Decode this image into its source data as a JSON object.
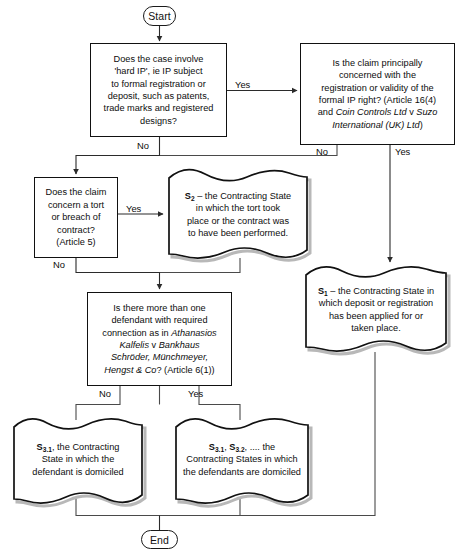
{
  "diagram": {
    "start_label": "Start",
    "end_label": "End",
    "colors": {
      "stroke": "#111111",
      "background": "#ffffff",
      "shadow": "#b8b8b8",
      "connector": "#4a4a4a"
    },
    "nodes": {
      "hard_ip": {
        "text": "Does the case involve 'hard IP', ie IP subject to formal registration or deposit, such as patents, trade marks and registered designs?",
        "shape": "process"
      },
      "registration_validity": {
        "text": "Is the claim principally concerned with the registration or validity of the formal IP right? (Article 16(4) and Coin Controls Ltd v Suzo International (UK) Ltd)",
        "italic_part": "Coin Controls Ltd v Suzo International (UK) Ltd",
        "shape": "process"
      },
      "tort_contract": {
        "text": "Does the claim concern a tort or breach of contract? (Article 5)",
        "shape": "process"
      },
      "more_defendants": {
        "text": "Is there more than one defendant with required connection as in Athanasios Kalfelis v Bankhaus Schröder, Münchmeyer, Hengst & Co? (Article 6(1))",
        "italic_part": "Athanasios Kalfelis v Bankhaus Schröder, Münchmeyer, Hengst & Co",
        "shape": "process"
      },
      "s2": {
        "label": "S2",
        "text": "S2 – the Contracting State in which the tort took place or the contract was to have been performed.",
        "shape": "document"
      },
      "s1": {
        "label": "S1",
        "text": "S1 – the Contracting State in which deposit or registration has been applied for or taken place.",
        "shape": "document"
      },
      "s31_single": {
        "label": "S3.1",
        "text": "S3.1, the Contracting State in which the defendant is domiciled",
        "shape": "document"
      },
      "s31_multi": {
        "label": "S3.1, S3.2",
        "text": "S3.1, S3.2, .... the Contracting States in which the defendants are domiciled",
        "shape": "document"
      }
    },
    "edge_labels": {
      "hard_ip_yes": "Yes",
      "hard_ip_no": "No",
      "registration_no": "No",
      "registration_yes": "Yes",
      "tort_yes": "Yes",
      "tort_no": "No",
      "defendants_no": "No",
      "defendants_yes": "Yes"
    }
  }
}
